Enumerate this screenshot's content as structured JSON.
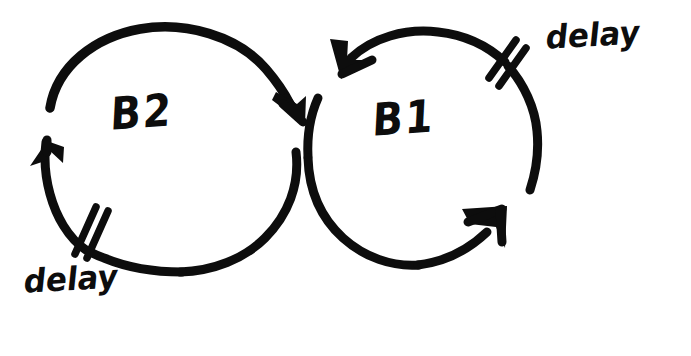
{
  "diagram": {
    "style": "hand-drawn sketch, black ink on white paper",
    "background_color": "#ffffff",
    "ink_color": "#0d0d0d",
    "canvas": {
      "width": 691,
      "height": 356
    },
    "nodes": [
      {
        "id": "b2",
        "label": "B2",
        "description": "left balancing loop",
        "center": {
          "x": 172,
          "y": 152
        },
        "radius": {
          "rx": 125,
          "ry": 122
        }
      },
      {
        "id": "b1",
        "label": "B1",
        "description": "right balancing loop",
        "center": {
          "x": 423,
          "y": 148
        },
        "radius": {
          "rx": 113,
          "ry": 114
        }
      }
    ],
    "loop_arrows": [
      {
        "id": "b2-clockwise-arc",
        "belongs_to": "b2",
        "direction": "clockwise",
        "arrowheads": [
          "top-right pointing down-right into junction",
          "left pointing up"
        ]
      },
      {
        "id": "b1-clockwise-arc",
        "belongs_to": "b1",
        "direction": "clockwise",
        "arrowheads": [
          "top-left pointing down-left into junction",
          "bottom-right pointing up-right"
        ]
      }
    ],
    "delay_marks": [
      {
        "id": "delay-mark-b2",
        "label": "delay",
        "glyph": "double-slash",
        "belongs_to": "b2",
        "position": "bottom-left of B2 loop",
        "label_position": {
          "x": 26,
          "y": 262
        }
      },
      {
        "id": "delay-mark-b1",
        "label": "delay",
        "glyph": "double-slash",
        "belongs_to": "b1",
        "position": "top-right of B1 loop",
        "label_position": {
          "x": 548,
          "y": 18
        }
      }
    ]
  }
}
